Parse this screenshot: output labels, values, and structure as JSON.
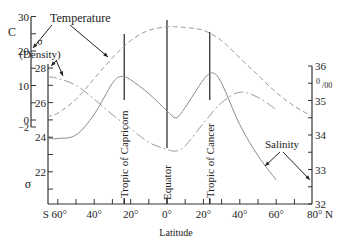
{
  "chart_data": {
    "type": "line",
    "title": "",
    "xlabel": "Latitude",
    "x_ticks": [
      "S 60°",
      "40°",
      "20°",
      "0°",
      "20°",
      "40°",
      "60°",
      "80° N"
    ],
    "x_tick_values": [
      -60,
      -40,
      -20,
      0,
      20,
      40,
      60,
      80
    ],
    "xlim": [
      -66,
      80
    ],
    "axes": {
      "temperature": {
        "label": "C",
        "ticks": [
          "30",
          "20",
          "10",
          "0",
          "−2"
        ],
        "tick_values": [
          30,
          20,
          10,
          0,
          -2
        ],
        "range": [
          -2,
          30
        ]
      },
      "density": {
        "label": "σ",
        "ticks": [
          "28",
          "26",
          "24",
          "22"
        ],
        "tick_values": [
          28,
          26,
          24,
          22
        ],
        "range": [
          20,
          28.5
        ]
      },
      "salinity": {
        "label": "‰",
        "ticks": [
          "36",
          "35",
          "34",
          "33",
          "32"
        ],
        "tick_values": [
          36,
          35,
          34,
          33,
          32
        ],
        "range": [
          32,
          36
        ]
      }
    },
    "series": [
      {
        "name": "Temperature",
        "axis": "temperature",
        "style": "dashed",
        "x": [
          -66,
          -60,
          -50,
          -40,
          -30,
          -20,
          -10,
          0,
          5,
          10,
          20,
          30,
          40,
          50,
          60,
          70,
          80
        ],
        "values": [
          1,
          2,
          6,
          12,
          18,
          23,
          26,
          27,
          27,
          26.8,
          26,
          23,
          18,
          13,
          8,
          4,
          1
        ]
      },
      {
        "name": "Salinity",
        "axis": "salinity",
        "style": "solid",
        "x": [
          -66,
          -60,
          -50,
          -40,
          -30,
          -25,
          -20,
          -10,
          0,
          5,
          10,
          20,
          25,
          30,
          40,
          50,
          60
        ],
        "values": [
          33.9,
          33.9,
          34.0,
          34.6,
          35.5,
          35.7,
          35.6,
          35.2,
          34.7,
          34.5,
          34.8,
          35.6,
          35.8,
          35.5,
          34.3,
          33.4,
          32.7
        ]
      },
      {
        "name": "Density",
        "axis": "density",
        "style": "dash-dot",
        "x": [
          -66,
          -60,
          -50,
          -40,
          -30,
          -20,
          -10,
          0,
          5,
          10,
          20,
          30,
          40,
          50,
          60
        ],
        "values": [
          27.5,
          27.4,
          27.0,
          26.2,
          25.3,
          24.5,
          23.7,
          23.3,
          23.2,
          23.5,
          24.8,
          26.0,
          26.6,
          26.3,
          25.6
        ]
      }
    ],
    "reference_lines": [
      {
        "label": "Tropic of Capricorn",
        "x": -23.5
      },
      {
        "label": "Equator",
        "x": 0
      },
      {
        "label": "Tropic of Cancer",
        "x": 23.5
      }
    ],
    "annotations": [
      "Temperature",
      "σ",
      "(Density)",
      "Salinity"
    ],
    "grid": false,
    "legend": "none (direct labels with arrows)"
  },
  "labels": {
    "temperature": "Temperature",
    "density_sigma": "σ",
    "density": "(Density)",
    "salinity": "Salinity",
    "temp_unit": "C",
    "sigma_axis": "σ",
    "salinity_unit_top": "0",
    "salinity_unit_bottom": "/00",
    "latitude": "Latitude",
    "capricorn": "Tropic of Capricorn",
    "equator": "Equator",
    "cancer": "Tropic of Cancer"
  }
}
